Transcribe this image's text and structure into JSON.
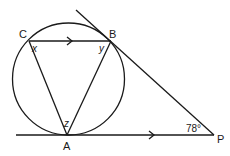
{
  "diagram": {
    "type": "circle-geometry",
    "circle": {
      "cx": 68.5,
      "cy": 79,
      "r": 56
    },
    "points": {
      "C": {
        "label": "C",
        "x": 29,
        "y": 41
      },
      "B": {
        "label": "B",
        "x": 111,
        "y": 41
      },
      "A": {
        "label": "A",
        "x": 67,
        "y": 135
      },
      "P": {
        "label": "P",
        "x": 214,
        "y": 135
      }
    },
    "angles": {
      "x": "x",
      "y": "y",
      "z": "z",
      "P": "78°"
    },
    "lines": [
      {
        "name": "chord-CB",
        "from": "C",
        "to": "B",
        "parallel_arrow": true
      },
      {
        "name": "chord-CA",
        "from": "C",
        "to": "A"
      },
      {
        "name": "chord-BA",
        "from": "B",
        "to": "A"
      },
      {
        "name": "tangent-AP",
        "from": "A",
        "to": "P",
        "parallel_arrow": true
      },
      {
        "name": "tangent-BP",
        "from": "B",
        "to": "P"
      }
    ],
    "colors": {
      "ink": "#1a1a1a",
      "background": "#ffffff"
    }
  }
}
